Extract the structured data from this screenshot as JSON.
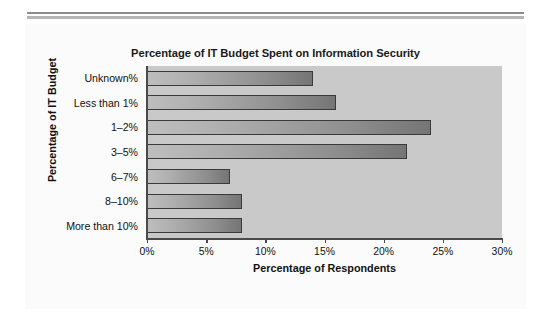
{
  "chart_data": {
    "type": "bar",
    "orientation": "horizontal",
    "title": "Percentage of IT Budget Spent on Information Security",
    "xlabel": "Percentage of Respondents",
    "ylabel": "Percentage of IT Budget",
    "categories": [
      "Unknown%",
      "Less than 1%",
      "1–2%",
      "3–5%",
      "6–7%",
      "8–10%",
      "More than 10%"
    ],
    "values": [
      14,
      16,
      24,
      22,
      7,
      8,
      8
    ],
    "xlim": [
      0,
      30
    ],
    "xticks": [
      0,
      5,
      10,
      15,
      20,
      25,
      30
    ],
    "xtick_labels": [
      "0%",
      "5%",
      "10%",
      "15%",
      "20%",
      "25%",
      "30%"
    ],
    "grid": false,
    "legend": false,
    "plot_background": "#c9c9c9",
    "bar_color_light": "#bebebe",
    "bar_color_dark": "#757575",
    "bar_border": "#3a3a3a"
  }
}
